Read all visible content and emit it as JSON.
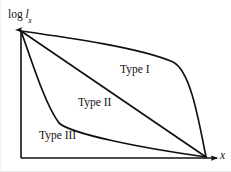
{
  "figure": {
    "kind": "survivorship-curves-diagram",
    "background_color": "#ffffff",
    "ink_color": "#111111"
  },
  "axes": {
    "y_label_prefix": "log ",
    "y_label_variable": "l",
    "y_label_subscript": "x",
    "y_label_full": "log lx",
    "x_label": "x",
    "origin_px": [
      20,
      158
    ],
    "y_axis_top_px": [
      20,
      25
    ],
    "x_axis_right_px": [
      226,
      158
    ],
    "has_arrowheads": true,
    "has_ticks": false,
    "has_gridlines": false
  },
  "curves": [
    {
      "id": "type-1",
      "label": "Type I",
      "label_position_px": [
        119,
        64
      ],
      "shape": "convex",
      "description": "high survival through most of life then rapid decline at end",
      "path": "M20,31 C70,38 140,48 172,62 C188,70 196,110 205,157",
      "points_px": [
        [
          20,
          31
        ],
        [
          80,
          42
        ],
        [
          140,
          52
        ],
        [
          172,
          62
        ],
        [
          186,
          78
        ],
        [
          196,
          120
        ],
        [
          205,
          157
        ]
      ]
    },
    {
      "id": "type-2",
      "label": "Type II",
      "label_position_px": [
        77,
        97
      ],
      "shape": "linear",
      "description": "constant rate of decline across all ages",
      "path": "M20,31 L205,157",
      "points_px": [
        [
          20,
          31
        ],
        [
          205,
          157
        ]
      ]
    },
    {
      "id": "type-3",
      "label": "Type III",
      "label_position_px": [
        38,
        130
      ],
      "shape": "concave",
      "description": "heavy early mortality then high survival of remaining individuals",
      "path": "M20,31 C31,62 44,104 58,123 C70,134 140,148 205,157",
      "points_px": [
        [
          20,
          31
        ],
        [
          40,
          92
        ],
        [
          58,
          123
        ],
        [
          80,
          130
        ],
        [
          140,
          147
        ],
        [
          205,
          157
        ]
      ]
    }
  ],
  "chart_data": {
    "type": "line",
    "title": "",
    "xlabel": "x",
    "ylabel": "log lx",
    "legend": [
      "Type I",
      "Type II",
      "Type III"
    ],
    "legend_position": "inline-annotations",
    "grid": false,
    "xlim": [
      0,
      1
    ],
    "ylim": [
      0,
      1
    ],
    "x": [
      0,
      0.2,
      0.4,
      0.6,
      0.8,
      1
    ],
    "series": [
      {
        "name": "Type I",
        "values": [
          1,
          0.93,
          0.88,
          0.83,
          0.62,
          0
        ]
      },
      {
        "name": "Type II",
        "values": [
          1,
          0.8,
          0.6,
          0.4,
          0.2,
          0
        ]
      },
      {
        "name": "Type III",
        "values": [
          1,
          0.42,
          0.22,
          0.16,
          0.1,
          0
        ]
      }
    ]
  }
}
